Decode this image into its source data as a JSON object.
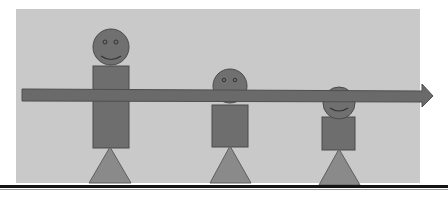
{
  "diagram": {
    "colors": {
      "background": "#ffffff",
      "panel": "#c9c9c9",
      "figure_fill": "#6e6e6e",
      "figure_stroke": "#4a4a4a",
      "triangle_fill": "#8a8a8a",
      "arrow_fill": "#6a6a6a",
      "rule": "#141414"
    },
    "figures": [
      {
        "name": "large",
        "head": {
          "cx": 111,
          "cy": 46,
          "r": 18
        },
        "body": {
          "x": 93,
          "y": 66,
          "w": 36,
          "h": 82
        },
        "legs": {
          "apex_x": 110,
          "apex_y": 146,
          "left": 89,
          "right": 130,
          "base_y": 183
        }
      },
      {
        "name": "medium",
        "head": {
          "cx": 229,
          "cy": 86,
          "r": 17
        },
        "body": {
          "x": 212,
          "y": 105,
          "w": 36,
          "h": 42
        },
        "legs": {
          "apex_x": 230,
          "apex_y": 145,
          "left": 210,
          "right": 251,
          "base_y": 183
        }
      },
      {
        "name": "small",
        "head": {
          "cx": 339,
          "cy": 103,
          "r": 16
        },
        "body": {
          "x": 322,
          "y": 117,
          "w": 33,
          "h": 33
        },
        "legs": {
          "apex_x": 339,
          "apex_y": 148,
          "left": 319,
          "right": 360,
          "base_y": 184
        }
      }
    ],
    "arrow": {
      "x_start": 22,
      "y_top": 89,
      "y_bottom": 101,
      "shaft_end": 422,
      "tip_x": 433,
      "head_top": 84,
      "head_bottom": 106
    }
  }
}
